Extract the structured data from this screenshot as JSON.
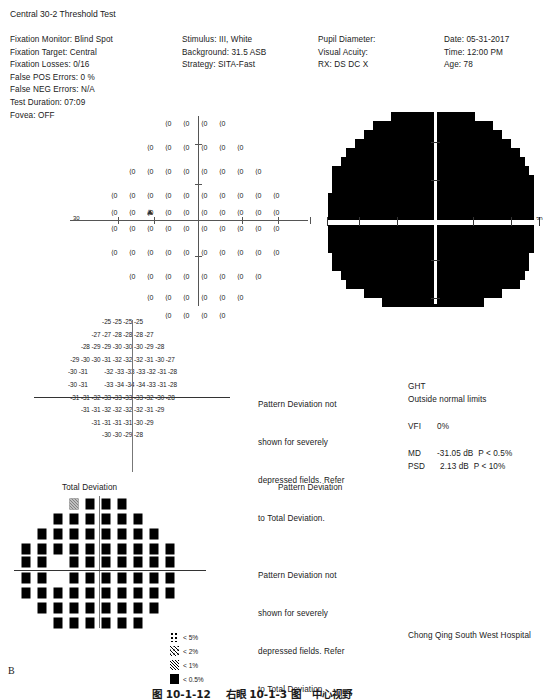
{
  "report": {
    "title": "Central 30-2 Threshold Test",
    "panel_label": "B",
    "hospital": "Chong Qing South West Hospital",
    "caption": "图 10-1-12    右眼 10-1-3 图   中心视野"
  },
  "params_col1": [
    {
      "label": "Fixation Monitor:",
      "value": "Blind Spot"
    },
    {
      "label": "Fixation Target:",
      "value": "Central"
    },
    {
      "label": "Fixation Losses:",
      "value": "0/16"
    },
    {
      "label": "False POS Errors:",
      "value": "0 %"
    },
    {
      "label": "False NEG Errors:",
      "value": "N/A"
    },
    {
      "label": "Test Duration:",
      "value": "07:09"
    },
    {
      "label": "Fovea:",
      "value": "OFF"
    }
  ],
  "params_col2": [
    {
      "label": "Stimulus:",
      "value": "III, White"
    },
    {
      "label": "Background:",
      "value": "31.5 ASB"
    },
    {
      "label": "Strategy:",
      "value": "SITA-Fast"
    }
  ],
  "params_col3": [
    {
      "label": "Pupil Diameter:",
      "value": ""
    },
    {
      "label": "Visual Acuity:",
      "value": ""
    },
    {
      "label": "RX:",
      "value": "DS      DC X"
    }
  ],
  "params_col4": [
    {
      "label": "Date:",
      "value": "05-31-2017"
    },
    {
      "label": "Time:",
      "value": "12:00 PM"
    },
    {
      "label": "Age:",
      "value": "78"
    }
  ],
  "axis": {
    "left_label": "30",
    "right_label": "30"
  },
  "threshold_grid": {
    "symbol": "⟨0",
    "blind_spot_marker": "triangle",
    "rows": [
      {
        "y": 8,
        "xs": [
          -30,
          -12,
          6,
          24
        ]
      },
      {
        "y": 32,
        "xs": [
          -48,
          -30,
          -12,
          6,
          24,
          42
        ]
      },
      {
        "y": 56,
        "xs": [
          -66,
          -48,
          -30,
          -12,
          6,
          24,
          42,
          60
        ]
      },
      {
        "y": 80,
        "xs": [
          -84,
          -66,
          -48,
          -30,
          -12,
          6,
          24,
          42,
          60,
          78
        ]
      },
      {
        "y": 97,
        "xs": [
          -84,
          -66,
          -48,
          -30,
          -12,
          6,
          24,
          42,
          60,
          78
        ]
      },
      {
        "y": 113,
        "xs": [
          -84,
          -66,
          -48,
          -30,
          -12,
          6,
          24,
          42,
          60,
          78
        ]
      },
      {
        "y": 137,
        "xs": [
          -84,
          -66,
          -48,
          -30,
          -12,
          6,
          24,
          42,
          60,
          78
        ]
      },
      {
        "y": 161,
        "xs": [
          -66,
          -48,
          -30,
          -12,
          6,
          24,
          42,
          60
        ]
      },
      {
        "y": 182,
        "xs": [
          -48,
          -30,
          -12,
          6,
          24,
          42
        ]
      },
      {
        "y": 200,
        "xs": [
          -30,
          -12,
          6,
          24
        ]
      }
    ]
  },
  "numeric_deviation": {
    "rows": [
      "-25 -25 -25 -25",
      "-27 -27 -28 -28 -28 -27",
      "-28 -29 -29 -30 -30 -30 -29 -28",
      "-29 -30 -30 -31 -32 -32 -32 -31 -30 -27",
      "-30 -31          -32 -33 -33 -33 -32 -31 -28",
      "-30 -31          -33 -34 -34 -34 -33 -31 -28",
      "-31 -31 -32 -33 -33 -33 -33 -32 -30 -28",
      "-31 -31 -32 -32 -32 -32 -31 -29",
      "-31 -31 -31 -31 -30 -29",
      "-30 -30 -29 -28"
    ]
  },
  "plot_titles": {
    "total_deviation": "Total Deviation",
    "pattern_deviation": "Pattern Deviation"
  },
  "pattern_deviation_note": {
    "line1": "Pattern Deviation not",
    "line2": "shown for severely",
    "line3": "depressed fields. Refer",
    "line4": "to Total Deviation."
  },
  "indices": {
    "ght_label": "GHT",
    "ght_value": "Outside normal limits",
    "vfi_label": "VFI",
    "vfi_value": "0%",
    "md_label": "MD",
    "md_value": "-31.05 dB  P < 0.5%",
    "psd_label": "PSD",
    "psd_value": "2.13 dB  P < 10%"
  },
  "probability_legend": [
    {
      "symbol": "p5",
      "label": "< 5%"
    },
    {
      "symbol": "p2",
      "label": "< 2%"
    },
    {
      "symbol": "p1",
      "label": "< 1%"
    },
    {
      "symbol": "p05",
      "label": "< 0.5%"
    }
  ],
  "td_plot": {
    "rows": [
      {
        "y": 4,
        "xs": [
          -26,
          -10,
          6,
          22
        ],
        "p1_index": 0
      },
      {
        "y": 19,
        "xs": [
          -42,
          -26,
          -10,
          6,
          22,
          38
        ],
        "p1_index": -1
      },
      {
        "y": 34,
        "xs": [
          -58,
          -42,
          -26,
          -10,
          6,
          22,
          38,
          54
        ],
        "p1_index": -1
      },
      {
        "y": 49,
        "xs": [
          -74,
          -58,
          -42,
          -26,
          -10,
          6,
          22,
          38,
          54,
          70
        ],
        "p1_index": -1
      },
      {
        "y": 62,
        "xs": [
          -74,
          -58,
          -26,
          -10,
          6,
          22,
          38,
          54,
          70
        ],
        "p1_index": -1
      },
      {
        "y": 78,
        "xs": [
          -74,
          -58,
          -26,
          -10,
          6,
          22,
          38,
          54,
          70
        ],
        "p1_index": -1
      },
      {
        "y": 93,
        "xs": [
          -74,
          -58,
          -42,
          -26,
          -10,
          6,
          22,
          38,
          54,
          70
        ],
        "p1_index": -1
      },
      {
        "y": 108,
        "xs": [
          -58,
          -42,
          -26,
          -10,
          6,
          22,
          38,
          54
        ],
        "p1_index": -1
      },
      {
        "y": 123,
        "xs": [
          -42,
          -26,
          -10,
          6,
          22,
          38
        ],
        "p1_index": -1
      }
    ]
  },
  "gray_map": {
    "rows": [
      {
        "y": 0,
        "x0": -44,
        "x1": 40
      },
      {
        "y": 9,
        "x0": -62,
        "x1": 58
      },
      {
        "y": 18,
        "x0": -71,
        "x1": 67
      },
      {
        "y": 27,
        "x0": -80,
        "x1": 76
      },
      {
        "y": 36,
        "x0": -89,
        "x1": 85
      },
      {
        "y": 45,
        "x0": -94,
        "x1": 90
      },
      {
        "y": 54,
        "x0": -103,
        "x1": 94
      },
      {
        "y": 63,
        "x0": -103,
        "x1": 99
      },
      {
        "y": 72,
        "x0": -103,
        "x1": 99
      },
      {
        "y": 81,
        "x0": -107,
        "x1": 99
      },
      {
        "y": 90,
        "x0": -107,
        "x1": 99
      },
      {
        "y": 99,
        "x0": -107,
        "x1": 99
      },
      {
        "y": 113,
        "x0": -107,
        "x1": 99
      },
      {
        "y": 122,
        "x0": -107,
        "x1": 99
      },
      {
        "y": 131,
        "x0": -107,
        "x1": 99
      },
      {
        "y": 140,
        "x0": -103,
        "x1": 94
      },
      {
        "y": 149,
        "x0": -103,
        "x1": 94
      },
      {
        "y": 158,
        "x0": -94,
        "x1": 90
      },
      {
        "y": 167,
        "x0": -89,
        "x1": 85
      },
      {
        "y": 176,
        "x0": -71,
        "x1": 67
      },
      {
        "y": 185,
        "x0": -53,
        "x1": 49
      }
    ]
  }
}
